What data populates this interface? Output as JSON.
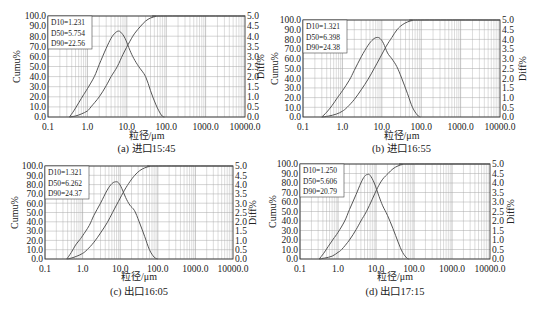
{
  "chart_data": [
    {
      "id": "a",
      "type": "line",
      "caption": "(a) 进口15:45",
      "xlabel": "粒径/μm",
      "ylabel_left": "Cumu%",
      "ylabel_right": "Diff%",
      "xscale": "log",
      "xlim": [
        0.1,
        10000
      ],
      "ylim_left": [
        0,
        100
      ],
      "ylim_right": [
        0,
        5
      ],
      "grid": true,
      "x_ticks": [
        "0.1",
        "1.0",
        "10.0",
        "100.0",
        "1000.0",
        "10000.0"
      ],
      "y_left_ticks": [
        "0.0",
        "10.0",
        "20.0",
        "30.0",
        "40.0",
        "50.0",
        "60.0",
        "70.0",
        "80.0",
        "90.0",
        "100.0"
      ],
      "y_right_ticks": [
        "0.0",
        "0.5",
        "1.0",
        "1.5",
        "2.0",
        "2.5",
        "3.0",
        "3.5",
        "4.0",
        "4.5",
        "5.0"
      ],
      "stats": [
        "D10=1.231",
        "D50=5.754",
        "D90=22.56"
      ],
      "legend_position": "top-left",
      "series": [
        {
          "name": "Cumu",
          "axis": "left",
          "x": [
            0.35,
            0.5,
            0.7,
            1.0,
            1.231,
            2.0,
            3.0,
            4.0,
            5.754,
            8.0,
            12.0,
            16.0,
            22.56,
            30.0,
            40.0,
            55.0,
            70.0,
            10000.0
          ],
          "y": [
            0,
            1,
            3,
            6,
            10,
            20,
            31,
            40,
            50,
            62,
            75,
            83,
            90,
            95,
            98,
            99.6,
            100,
            100
          ]
        },
        {
          "name": "Diff",
          "axis": "right",
          "x": [
            0.35,
            0.45,
            0.6,
            0.8,
            1.0,
            1.5,
            2.0,
            3.0,
            4.0,
            5.0,
            6.0,
            7.0,
            9.0,
            12.0,
            15.0,
            20.0,
            30.0,
            40.0,
            55.0,
            75.0,
            90.0
          ],
          "y": [
            0,
            0.3,
            0.7,
            1.1,
            1.4,
            2.0,
            2.6,
            3.4,
            3.9,
            4.15,
            4.25,
            4.2,
            3.9,
            3.3,
            2.9,
            2.5,
            2.0,
            1.3,
            0.6,
            0.1,
            0
          ]
        }
      ]
    },
    {
      "id": "b",
      "type": "line",
      "caption": "(b) 进口16:55",
      "xlabel": "粒径/μm",
      "ylabel_left": "Cumu%",
      "ylabel_right": "Diff%",
      "xscale": "log",
      "xlim": [
        0.1,
        10000
      ],
      "ylim_left": [
        0,
        100
      ],
      "ylim_right": [
        0,
        5
      ],
      "grid": true,
      "x_ticks": [
        "0.1",
        "1.0",
        "10.0",
        "100.0",
        "1000.0",
        "10000.0"
      ],
      "y_left_ticks": [
        "0.0",
        "10.0",
        "20.0",
        "30.0",
        "40.0",
        "50.0",
        "60.0",
        "70.0",
        "80.0",
        "90.0",
        "100.0"
      ],
      "y_right_ticks": [
        "0.0",
        "0.5",
        "1.0",
        "1.5",
        "2.0",
        "2.5",
        "3.0",
        "3.5",
        "4.0",
        "4.5",
        "5.0"
      ],
      "stats": [
        "D10=1.321",
        "D50=6.398",
        "D90=24.38"
      ],
      "legend_position": "top-left",
      "series": [
        {
          "name": "Cumu",
          "axis": "left",
          "x": [
            0.3,
            0.45,
            0.7,
            1.0,
            1.321,
            2.0,
            3.0,
            4.5,
            6.398,
            9.0,
            13.0,
            18.0,
            24.38,
            33.0,
            45.0,
            60.0,
            80.0,
            10000.0
          ],
          "y": [
            0,
            1,
            3,
            6,
            10,
            18,
            28,
            39,
            50,
            61,
            73,
            82,
            90,
            95,
            98,
            99.5,
            100,
            100
          ]
        },
        {
          "name": "Diff",
          "axis": "right",
          "x": [
            0.3,
            0.4,
            0.55,
            0.75,
            1.0,
            1.5,
            2.0,
            3.0,
            4.5,
            6.0,
            7.5,
            9.0,
            11.0,
            14.0,
            18.0,
            24.0,
            32.0,
            45.0,
            60.0,
            80.0,
            95.0
          ],
          "y": [
            0,
            0.25,
            0.6,
            1.0,
            1.35,
            1.9,
            2.4,
            3.1,
            3.7,
            4.0,
            4.1,
            4.05,
            3.8,
            3.3,
            3.0,
            2.6,
            2.0,
            1.2,
            0.5,
            0.1,
            0
          ]
        }
      ]
    },
    {
      "id": "c",
      "type": "line",
      "caption": "(c) 出口16:05",
      "xlabel": "粒径/μm",
      "ylabel_left": "Cumu%",
      "ylabel_right": "Diff%",
      "xscale": "log",
      "xlim": [
        0.1,
        10000
      ],
      "ylim_left": [
        0,
        100
      ],
      "ylim_right": [
        0,
        5
      ],
      "grid": true,
      "x_ticks": [
        "0.1",
        "1.0",
        "10.0",
        "100.0",
        "1000.0",
        "10000.0"
      ],
      "y_left_ticks": [
        "0.0",
        "10.0",
        "20.0",
        "30.0",
        "40.0",
        "50.0",
        "60.0",
        "70.0",
        "80.0",
        "90.0",
        "100.0"
      ],
      "y_right_ticks": [
        "0.0",
        "0.5",
        "1.0",
        "1.5",
        "2.0",
        "2.5",
        "3.0",
        "3.5",
        "4.0",
        "4.5",
        "5.0"
      ],
      "stats": [
        "D10=1.321",
        "D50=6.262",
        "D90=24.37"
      ],
      "legend_position": "top-left",
      "series": [
        {
          "name": "Cumu",
          "axis": "left",
          "x": [
            0.38,
            0.5,
            0.7,
            1.0,
            1.321,
            2.0,
            3.0,
            4.5,
            6.262,
            9.0,
            13.0,
            18.0,
            24.37,
            33.0,
            45.0,
            60.0,
            85.0,
            10000.0
          ],
          "y": [
            0,
            1,
            3,
            6,
            10,
            18,
            28,
            39,
            50,
            62,
            74,
            83,
            90,
            95,
            98,
            99.5,
            100,
            100
          ]
        },
        {
          "name": "Diff",
          "axis": "right",
          "x": [
            0.38,
            0.5,
            0.65,
            0.85,
            1.0,
            1.5,
            2.0,
            3.0,
            4.5,
            6.0,
            7.5,
            9.0,
            11.0,
            14.0,
            18.0,
            24.0,
            32.0,
            45.0,
            60.0,
            80.0,
            100.0
          ],
          "y": [
            0,
            0.35,
            0.75,
            1.05,
            1.25,
            1.8,
            2.35,
            3.0,
            3.7,
            4.05,
            4.15,
            4.1,
            3.8,
            3.3,
            2.9,
            2.6,
            2.0,
            1.2,
            0.5,
            0.1,
            0
          ]
        }
      ]
    },
    {
      "id": "d",
      "type": "line",
      "caption": "(d) 出口17:15",
      "xlabel": "粒径/μm",
      "ylabel_left": "Cumu%",
      "ylabel_right": "Diff%",
      "xscale": "log",
      "xlim": [
        0.1,
        10000
      ],
      "ylim_left": [
        0,
        100
      ],
      "ylim_right": [
        0,
        5
      ],
      "grid": true,
      "x_ticks": [
        "0.1",
        "1.0",
        "10.0",
        "100.0",
        "1000.0",
        "10000.0"
      ],
      "y_left_ticks": [
        "0.0",
        "10.0",
        "20.0",
        "30.0",
        "40.0",
        "50.0",
        "60.0",
        "70.0",
        "80.0",
        "90.0",
        "100.0"
      ],
      "y_right_ticks": [
        "0.0",
        "0.5",
        "1.0",
        "1.5",
        "2.0",
        "2.5",
        "3.0",
        "3.5",
        "4.0",
        "4.5",
        "5.0"
      ],
      "stats": [
        "D10=1.250",
        "D50=5.606",
        "D90=20.79"
      ],
      "legend_position": "top-left",
      "series": [
        {
          "name": "Cumu",
          "axis": "left",
          "x": [
            0.32,
            0.45,
            0.7,
            1.0,
            1.25,
            2.0,
            3.0,
            4.0,
            5.606,
            8.0,
            11.0,
            15.0,
            20.79,
            28.0,
            38.0,
            50.0,
            65.0,
            10000.0
          ],
          "y": [
            0,
            1,
            3,
            7,
            10,
            20,
            31,
            40,
            50,
            63,
            75,
            84,
            90,
            95,
            98,
            99.5,
            100,
            100
          ]
        },
        {
          "name": "Diff",
          "axis": "right",
          "x": [
            0.32,
            0.42,
            0.55,
            0.75,
            1.0,
            1.5,
            2.0,
            3.0,
            4.0,
            5.0,
            6.0,
            7.0,
            9.0,
            12.0,
            15.0,
            20.0,
            28.0,
            38.0,
            50.0,
            65.0,
            75.0
          ],
          "y": [
            0,
            0.3,
            0.65,
            1.05,
            1.4,
            2.0,
            2.6,
            3.4,
            4.0,
            4.35,
            4.45,
            4.4,
            4.0,
            3.3,
            2.8,
            2.3,
            1.6,
            0.9,
            0.35,
            0.05,
            0
          ]
        }
      ]
    }
  ]
}
